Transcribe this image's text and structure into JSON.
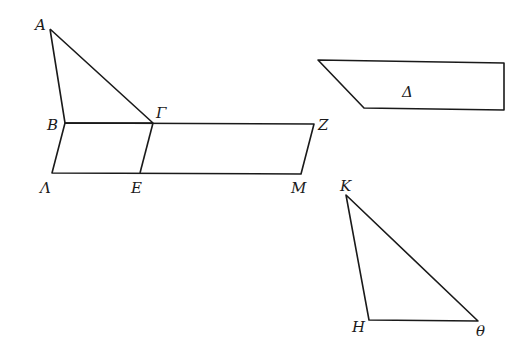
{
  "figure": {
    "points": {
      "A": {
        "label": "A",
        "x": 50,
        "y": 29
      },
      "B": {
        "label": "B",
        "x": 65,
        "y": 123
      },
      "G": {
        "label": "Γ",
        "x": 153,
        "y": 123
      },
      "Z": {
        "label": "Z",
        "x": 314,
        "y": 124
      },
      "L": {
        "label": "Λ",
        "x": 52,
        "y": 173
      },
      "E": {
        "label": "E",
        "x": 140,
        "y": 173
      },
      "M": {
        "label": "M",
        "x": 301,
        "y": 174
      },
      "K": {
        "label": "K",
        "x": 346,
        "y": 195
      },
      "H": {
        "label": "H",
        "x": 369,
        "y": 320
      },
      "TH": {
        "label": "θ",
        "x": 478,
        "y": 321
      }
    },
    "shapes": {
      "triangle_ABG": "A-B-Γ",
      "parallelogram_BGEL": "B-Γ-E-Λ",
      "parallelogram_GZME": "Γ-Z-M-E",
      "quad_delta": {
        "label": "Δ"
      },
      "triangle_KHTH": "K-H-θ"
    }
  }
}
